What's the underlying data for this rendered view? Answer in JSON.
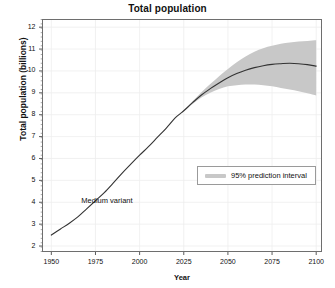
{
  "chart_data": {
    "type": "line",
    "title": "Total population",
    "xlabel": "Year",
    "ylabel": "Total population (billions)",
    "xlim": [
      1945,
      2103
    ],
    "ylim": [
      1.75,
      12.35
    ],
    "grid": true,
    "legend_position": "lower-right-inside",
    "x_ticks": [
      "1950",
      "1975",
      "2000",
      "2025",
      "2050",
      "2075",
      "2100"
    ],
    "x_tick_values": [
      1950,
      1975,
      2000,
      2025,
      2050,
      2075,
      2100
    ],
    "y_ticks": [
      "2",
      "3",
      "4",
      "5",
      "6",
      "7",
      "8",
      "9",
      "10",
      "11",
      "12"
    ],
    "y_tick_values": [
      2,
      3,
      4,
      5,
      6,
      7,
      8,
      9,
      10,
      11,
      12
    ],
    "annotations": [
      {
        "text": "Medium variant",
        "x": 1967,
        "y": 4.05
      }
    ],
    "legend": [
      {
        "label": "95% prediction interval",
        "color": "#c8c8c8"
      }
    ],
    "series": [
      {
        "name": "Medium variant",
        "type": "line",
        "color": "#333333",
        "x": [
          1950,
          1955,
          1960,
          1965,
          1970,
          1975,
          1980,
          1985,
          1990,
          1995,
          2000,
          2005,
          2010,
          2015,
          2020,
          2023,
          2025,
          2030,
          2035,
          2040,
          2045,
          2050,
          2055,
          2060,
          2065,
          2070,
          2075,
          2080,
          2085,
          2090,
          2095,
          2100
        ],
        "values": [
          2.5,
          2.77,
          3.03,
          3.33,
          3.7,
          4.07,
          4.44,
          4.87,
          5.32,
          5.74,
          6.15,
          6.54,
          6.96,
          7.38,
          7.84,
          8.05,
          8.18,
          8.55,
          8.9,
          9.19,
          9.45,
          9.69,
          9.88,
          10.03,
          10.15,
          10.24,
          10.3,
          10.33,
          10.35,
          10.33,
          10.29,
          10.22
        ]
      },
      {
        "name": "95% prediction interval",
        "type": "band",
        "color": "#c8c8c8",
        "x": [
          2023,
          2025,
          2030,
          2035,
          2040,
          2045,
          2050,
          2055,
          2060,
          2065,
          2070,
          2075,
          2080,
          2085,
          2090,
          2095,
          2100
        ],
        "lower": [
          8.05,
          8.16,
          8.49,
          8.79,
          9.0,
          9.18,
          9.3,
          9.35,
          9.38,
          9.38,
          9.35,
          9.3,
          9.22,
          9.15,
          9.07,
          8.98,
          8.88
        ],
        "upper": [
          8.05,
          8.2,
          8.62,
          9.03,
          9.4,
          9.76,
          10.09,
          10.4,
          10.66,
          10.88,
          11.04,
          11.15,
          11.24,
          11.3,
          11.34,
          11.37,
          11.4
        ]
      }
    ]
  }
}
